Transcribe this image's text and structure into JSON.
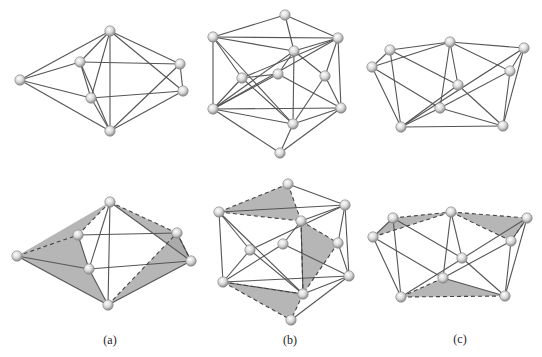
{
  "figure": {
    "panels": [
      {
        "id": "a",
        "label": "(a)",
        "label_pos": [
          110,
          344
        ],
        "top": {
          "nodes": [
            [
              110,
              31
            ],
            [
              20,
              80
            ],
            [
              80,
              62
            ],
            [
              91,
              98
            ],
            [
              110,
              131
            ],
            [
              180,
              64
            ],
            [
              183,
              91
            ]
          ],
          "edges": [
            [
              0,
              1
            ],
            [
              0,
              2
            ],
            [
              0,
              3
            ],
            [
              0,
              4
            ],
            [
              0,
              5
            ],
            [
              0,
              6
            ],
            [
              1,
              2
            ],
            [
              1,
              3
            ],
            [
              1,
              4
            ],
            [
              2,
              3
            ],
            [
              2,
              5
            ],
            [
              3,
              6
            ],
            [
              3,
              4
            ],
            [
              2,
              4
            ],
            [
              4,
              5
            ],
            [
              4,
              6
            ],
            [
              5,
              6
            ]
          ]
        },
        "bottom": {
          "nodes": [
            [
              110,
              202
            ],
            [
              17,
              256
            ],
            [
              78,
              235
            ],
            [
              89,
              269
            ],
            [
              108,
              305
            ],
            [
              177,
              233
            ],
            [
              191,
              261
            ]
          ],
          "edges": [
            [
              0,
              3
            ],
            [
              0,
              4
            ],
            [
              0,
              6
            ],
            [
              2,
              3
            ],
            [
              3,
              4
            ],
            [
              3,
              6
            ],
            [
              1,
              3
            ],
            [
              1,
              4
            ],
            [
              4,
              6
            ],
            [
              5,
              6
            ],
            [
              2,
              5
            ]
          ],
          "dashed": [
            [
              0,
              2
            ],
            [
              1,
              2
            ],
            [
              0,
              5
            ],
            [
              4,
              5
            ],
            [
              5,
              6
            ]
          ],
          "faces": [
            [
              0,
              1,
              2
            ],
            [
              1,
              3,
              4
            ],
            [
              1,
              2,
              3
            ],
            [
              0,
              5,
              6
            ],
            [
              4,
              5,
              6
            ]
          ]
        }
      },
      {
        "id": "b",
        "label": "(b)",
        "label_pos": [
          290,
          344
        ],
        "top": {
          "nodes": [
            [
              285,
              15
            ],
            [
              213,
              37
            ],
            [
              338,
              38
            ],
            [
              294,
              51
            ],
            [
              242,
              78
            ],
            [
              278,
              74
            ],
            [
              325,
              76
            ],
            [
              213,
              109
            ],
            [
              341,
              108
            ],
            [
              293,
              124
            ],
            [
              280,
              153
            ]
          ],
          "edges": [
            [
              0,
              1
            ],
            [
              0,
              2
            ],
            [
              0,
              3
            ],
            [
              1,
              2
            ],
            [
              1,
              3
            ],
            [
              1,
              7
            ],
            [
              1,
              4
            ],
            [
              1,
              9
            ],
            [
              2,
              3
            ],
            [
              2,
              8
            ],
            [
              2,
              6
            ],
            [
              2,
              4
            ],
            [
              3,
              5
            ],
            [
              3,
              6
            ],
            [
              3,
              9
            ],
            [
              4,
              7
            ],
            [
              4,
              9
            ],
            [
              5,
              4
            ],
            [
              5,
              8
            ],
            [
              6,
              8
            ],
            [
              6,
              9
            ],
            [
              7,
              8
            ],
            [
              7,
              9
            ],
            [
              7,
              10
            ],
            [
              7,
              5
            ],
            [
              8,
              9
            ],
            [
              8,
              10
            ],
            [
              9,
              10
            ],
            [
              3,
              7
            ],
            [
              2,
              7
            ]
          ]
        },
        "bottom": {
          "nodes": [
            [
              288,
              184
            ],
            [
              219,
              212
            ],
            [
              345,
              205
            ],
            [
              301,
              221
            ],
            [
              250,
              250
            ],
            [
              283,
              244
            ],
            [
              338,
              243
            ],
            [
              223,
              282
            ],
            [
              349,
              276
            ],
            [
              303,
              294
            ],
            [
              291,
              320
            ]
          ],
          "edges": [
            [
              0,
              2
            ],
            [
              1,
              2
            ],
            [
              1,
              7
            ],
            [
              1,
              4
            ],
            [
              1,
              9
            ],
            [
              2,
              8
            ],
            [
              2,
              6
            ],
            [
              2,
              4
            ],
            [
              3,
              5
            ],
            [
              4,
              7
            ],
            [
              4,
              9
            ],
            [
              5,
              8
            ],
            [
              6,
              8
            ],
            [
              7,
              8
            ],
            [
              7,
              9
            ],
            [
              8,
              9
            ],
            [
              8,
              10
            ],
            [
              2,
              3
            ],
            [
              3,
              9
            ],
            [
              7,
              5
            ]
          ],
          "dashed": [
            [
              0,
              1
            ],
            [
              0,
              3
            ],
            [
              1,
              3
            ],
            [
              3,
              6
            ],
            [
              6,
              9
            ],
            [
              3,
              9
            ],
            [
              7,
              10
            ],
            [
              9,
              10
            ],
            [
              7,
              9
            ]
          ],
          "faces": [
            [
              0,
              1,
              3
            ],
            [
              3,
              6,
              9
            ],
            [
              7,
              9,
              10
            ]
          ]
        }
      },
      {
        "id": "c",
        "label": "(c)",
        "label_pos": [
          460,
          343
        ],
        "top": {
          "nodes": [
            [
              372,
              67
            ],
            [
              390,
              50
            ],
            [
              450,
              42
            ],
            [
              524,
              48
            ],
            [
              510,
              71
            ],
            [
              458,
              85
            ],
            [
              440,
              108
            ],
            [
              401,
              127
            ],
            [
              503,
              126
            ]
          ],
          "edges": [
            [
              0,
              1
            ],
            [
              0,
              2
            ],
            [
              1,
              2
            ],
            [
              2,
              3
            ],
            [
              0,
              7
            ],
            [
              0,
              6
            ],
            [
              1,
              7
            ],
            [
              1,
              5
            ],
            [
              2,
              6
            ],
            [
              2,
              5
            ],
            [
              2,
              4
            ],
            [
              3,
              4
            ],
            [
              3,
              7
            ],
            [
              3,
              8
            ],
            [
              4,
              6
            ],
            [
              4,
              8
            ],
            [
              5,
              7
            ],
            [
              5,
              8
            ],
            [
              6,
              7
            ],
            [
              6,
              8
            ],
            [
              7,
              8
            ]
          ]
        },
        "bottom": {
          "nodes": [
            [
              373,
              237
            ],
            [
              393,
              218
            ],
            [
              451,
              212
            ],
            [
              527,
              218
            ],
            [
              511,
              241
            ],
            [
              462,
              258
            ],
            [
              443,
              278
            ],
            [
              401,
              297
            ],
            [
              505,
              296
            ]
          ],
          "edges": [
            [
              0,
              1
            ],
            [
              0,
              7
            ],
            [
              0,
              6
            ],
            [
              1,
              7
            ],
            [
              1,
              5
            ],
            [
              2,
              6
            ],
            [
              2,
              5
            ],
            [
              3,
              4
            ],
            [
              3,
              7
            ],
            [
              3,
              8
            ],
            [
              4,
              6
            ],
            [
              4,
              8
            ],
            [
              5,
              8
            ],
            [
              6,
              8
            ]
          ],
          "dashed": [
            [
              0,
              2
            ],
            [
              1,
              2
            ],
            [
              2,
              3
            ],
            [
              2,
              4
            ],
            [
              6,
              7
            ],
            [
              7,
              8
            ],
            [
              3,
              4
            ]
          ],
          "faces": [
            [
              0,
              1,
              2
            ],
            [
              2,
              3,
              4
            ],
            [
              6,
              7,
              8
            ]
          ]
        }
      }
    ]
  }
}
